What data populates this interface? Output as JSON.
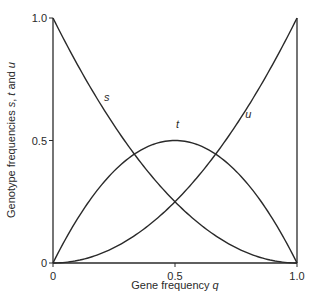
{
  "chart_data": {
    "type": "line",
    "title": "",
    "xlabel": "Gene frequency q",
    "xlabel_text": "Gene frequency ",
    "xlabel_var": "q",
    "ylabel": "Genotype frequencies s, t and u",
    "xlim": [
      0,
      1.0
    ],
    "ylim": [
      0,
      1.0
    ],
    "grid": false,
    "legend": "inline curve labels",
    "x_ticks": [
      {
        "value": 0,
        "label": "0"
      },
      {
        "value": 0.5,
        "label": "0.5"
      },
      {
        "value": 1.0,
        "label": "1.0"
      }
    ],
    "y_ticks": [
      {
        "value": 0,
        "label": "0"
      },
      {
        "value": 0.5,
        "label": "0.5"
      },
      {
        "value": 1.0,
        "label": "1.0"
      }
    ],
    "x": [
      0,
      0.1,
      0.2,
      0.3,
      0.4,
      0.5,
      0.6,
      0.7,
      0.8,
      0.9,
      1.0
    ],
    "series": [
      {
        "name": "s",
        "formula": "(1-q)^2",
        "values": [
          1.0,
          0.81,
          0.64,
          0.49,
          0.36,
          0.25,
          0.16,
          0.09,
          0.04,
          0.01,
          0.0
        ],
        "label_pos": [
          0.22,
          0.66
        ]
      },
      {
        "name": "t",
        "formula": "2q(1-q)",
        "values": [
          0.0,
          0.18,
          0.32,
          0.42,
          0.48,
          0.5,
          0.48,
          0.42,
          0.32,
          0.18,
          0.0
        ],
        "label_pos": [
          0.51,
          0.55
        ]
      },
      {
        "name": "u",
        "formula": "q^2",
        "values": [
          0.0,
          0.01,
          0.04,
          0.09,
          0.16,
          0.25,
          0.36,
          0.49,
          0.64,
          0.81,
          1.0
        ],
        "label_pos": [
          0.8,
          0.59
        ]
      }
    ],
    "line_color": "#2a2a2a"
  }
}
